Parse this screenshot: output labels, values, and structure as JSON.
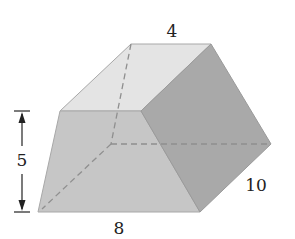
{
  "figure": {
    "labels": {
      "top_edge": "4",
      "height": "5",
      "bottom_edge": "8",
      "depth": "10"
    },
    "colors": {
      "top_face": "#e4e4e4",
      "front_face": "#c6c6c6",
      "right_face": "#a9a9a9",
      "edge": "#9a9a9a",
      "hidden_edge": "#8f8f8f",
      "dimension_line": "#222222"
    }
  }
}
